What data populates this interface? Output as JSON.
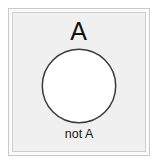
{
  "diagram": {
    "kind": "euler-set-diagram",
    "universe_label": "not A",
    "set_label": "A",
    "colors": {
      "page_background": "#ffffff",
      "universe_fill": "#f0f0f0",
      "set_fill": "#ffffff",
      "set_stroke": "#3a3a3a",
      "frame_outer_stroke": "#c9c9c9",
      "frame_inner_stroke": "#cfcfcf",
      "label_color": "#111111"
    }
  }
}
